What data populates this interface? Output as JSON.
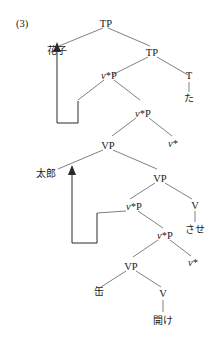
{
  "figure": {
    "example_number": "(3)",
    "type": "syntactic-tree-diagram",
    "colors": {
      "text": "#1a1a1a",
      "branch": "#555555",
      "movement": "#2b2b2b",
      "background": "#ffffff"
    }
  },
  "nodes": {
    "tp_root": "TP",
    "hanako": "花子",
    "tp_inner": "TP",
    "vstarp_1_v": "v",
    "vstarp_1_rest": "*P",
    "t_head": "T",
    "ta": "た",
    "vstarp_2_v": "v",
    "vstarp_2_rest": "*P",
    "vp_1": "VP",
    "vstar_1_v": "v",
    "vstar_1_rest": "*",
    "taro": "太郎",
    "vp_2": "VP",
    "vstarp_3_v": "v",
    "vstarp_3_rest": "*P",
    "v_head_1": "V",
    "sase": "させ",
    "vstarp_4_v": "v",
    "vstarp_4_rest": "*P",
    "vstar_2_v": "v",
    "vstar_2_rest": "*",
    "vp_3": "VP",
    "kan": "缶",
    "v_head_2": "V",
    "ake": "開け"
  }
}
